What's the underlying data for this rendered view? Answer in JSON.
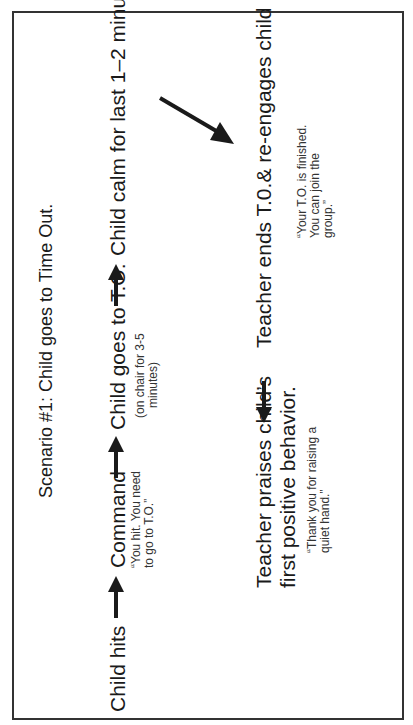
{
  "title": "Scenario #1: Child goes to Time Out.",
  "steps": [
    {
      "label": "Child hits"
    },
    {
      "label": "Command",
      "note": "“You hit. You need to go to T.O.”",
      "note_lines": [
        "“You hit. You need",
        "to go to T.O.”"
      ]
    },
    {
      "label": "Child goes to T.O.",
      "note_lines": [
        "(on chair for 3-5",
        "minutes)"
      ]
    },
    {
      "label": "Child calm for last 1–2 minutes"
    },
    {
      "label": "Teacher ends T.0.& re-engages child",
      "note_lines": [
        "“Your T.O. is finished.",
        "You can join the",
        "group.”"
      ]
    },
    {
      "label_lines": [
        "Teacher praises child’s",
        "first positive behavior."
      ],
      "note_lines": [
        "“Thank you for raising a",
        "quiet hand.”"
      ]
    }
  ],
  "arrows": [
    "right",
    "right",
    "right",
    "diagonal-down",
    "left"
  ],
  "colors": {
    "ink": "#1a1a1a",
    "border": "#333333"
  }
}
